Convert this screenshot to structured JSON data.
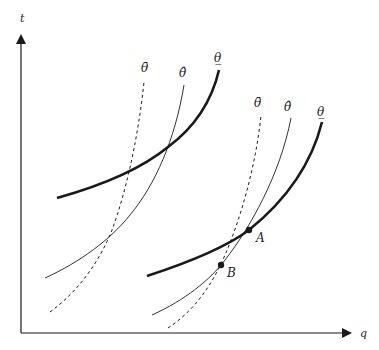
{
  "axes": {
    "y_label": "t",
    "x_label": "q"
  },
  "curve_labels": {
    "left": {
      "dashed": "θ̄",
      "thin": "θ̂",
      "thick": "θ̲"
    },
    "right": {
      "dashed": "θ̄",
      "thin": "θ̂",
      "thick": "θ̲"
    }
  },
  "points": {
    "A": "A",
    "B": "B"
  },
  "colors": {
    "line": "#1a1a1a",
    "background": "#ffffff"
  }
}
